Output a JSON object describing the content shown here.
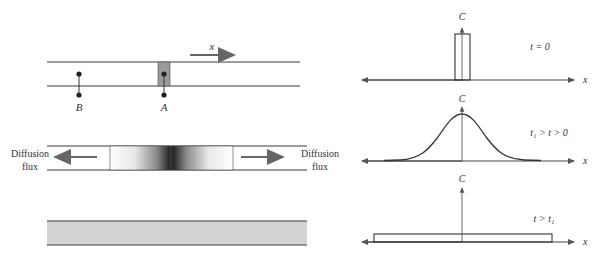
{
  "figure": {
    "left": {
      "top_tube": {
        "axis_label": "x",
        "points": [
          {
            "label": "B"
          },
          {
            "label": "A"
          }
        ]
      },
      "middle_tube": {
        "left_flux": {
          "line1": "Diffusion",
          "line2": "flux"
        },
        "right_flux": {
          "line1": "Diffusion",
          "line2": "flux"
        }
      },
      "bottom_tube": {}
    },
    "right": {
      "plots": [
        {
          "y_label": "C",
          "x_label": "x",
          "condition": "t = 0",
          "shape": "narrow rectangle"
        },
        {
          "y_label": "C",
          "x_label": "x",
          "condition": "t₁ > t > 0",
          "shape": "gaussian"
        },
        {
          "y_label": "C",
          "x_label": "x",
          "condition": "t > t₁",
          "shape": "wide flat rectangle"
        }
      ]
    },
    "colors": {
      "line": "#3a3a3a",
      "slab": "#9a9a9a",
      "band": "#d3d3d3",
      "arrow": "#666666"
    }
  }
}
